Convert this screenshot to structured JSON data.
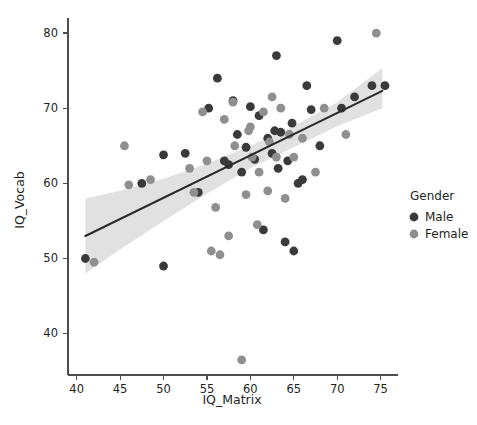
{
  "chart_data": {
    "type": "scatter",
    "title": "",
    "xlabel": "IQ_Matrix",
    "ylabel": "IQ_Vocab",
    "xlim": [
      39.0,
      77.0
    ],
    "ylim": [
      34.5,
      82.0
    ],
    "xticks": [
      40,
      45,
      50,
      55,
      60,
      65,
      70,
      75
    ],
    "yticks": [
      40,
      50,
      60,
      70,
      80
    ],
    "xtick_labels": [
      "40",
      "45",
      "50",
      "55",
      "60",
      "65",
      "70",
      "75"
    ],
    "ytick_labels": [
      "40",
      "50",
      "60",
      "70",
      "80"
    ],
    "grid": false,
    "legend_position": "right",
    "legend": {
      "title": "Gender",
      "entries": [
        {
          "label": "Male",
          "color": "#3a3a3a"
        },
        {
          "label": "Female",
          "color": "#8f8f8f"
        }
      ]
    },
    "series": [
      {
        "name": "Male",
        "color": "#3a3a3a",
        "marker": "circle",
        "points": [
          [
            41.0,
            50.0
          ],
          [
            47.5,
            60.0
          ],
          [
            50.0,
            49.0
          ],
          [
            50.0,
            63.8
          ],
          [
            54.0,
            58.8
          ],
          [
            55.2,
            70.0
          ],
          [
            56.2,
            74.0
          ],
          [
            57.0,
            63.0
          ],
          [
            57.5,
            62.5
          ],
          [
            58.5,
            66.5
          ],
          [
            59.0,
            61.5
          ],
          [
            59.5,
            64.8
          ],
          [
            60.0,
            70.2
          ],
          [
            60.5,
            63.2
          ],
          [
            61.0,
            69.0
          ],
          [
            61.5,
            53.8
          ],
          [
            62.0,
            66.0
          ],
          [
            62.5,
            64.0
          ],
          [
            62.8,
            67.0
          ],
          [
            63.0,
            77.0
          ],
          [
            63.2,
            62.0
          ],
          [
            63.5,
            66.8
          ],
          [
            64.0,
            52.2
          ],
          [
            64.3,
            63.0
          ],
          [
            64.8,
            68.0
          ],
          [
            65.0,
            51.0
          ],
          [
            65.5,
            60.0
          ],
          [
            66.0,
            60.5
          ],
          [
            66.5,
            73.0
          ],
          [
            67.0,
            69.8
          ],
          [
            68.0,
            65.0
          ],
          [
            70.0,
            79.0
          ],
          [
            70.5,
            70.0
          ],
          [
            72.0,
            71.5
          ],
          [
            74.0,
            73.0
          ],
          [
            75.5,
            73.0
          ],
          [
            58.0,
            71.0
          ],
          [
            52.5,
            64.0
          ]
        ]
      },
      {
        "name": "Female",
        "color": "#8f8f8f",
        "marker": "circle",
        "points": [
          [
            42.0,
            49.5
          ],
          [
            45.5,
            65.0
          ],
          [
            46.0,
            59.8
          ],
          [
            48.5,
            60.5
          ],
          [
            53.0,
            62.0
          ],
          [
            54.5,
            69.5
          ],
          [
            55.0,
            63.0
          ],
          [
            55.5,
            51.0
          ],
          [
            56.0,
            56.8
          ],
          [
            56.5,
            50.5
          ],
          [
            57.0,
            68.5
          ],
          [
            57.5,
            53.0
          ],
          [
            58.0,
            70.8
          ],
          [
            58.2,
            65.0
          ],
          [
            59.0,
            36.5
          ],
          [
            59.5,
            58.5
          ],
          [
            60.0,
            67.5
          ],
          [
            60.2,
            63.5
          ],
          [
            60.8,
            54.5
          ],
          [
            61.0,
            61.5
          ],
          [
            61.5,
            69.5
          ],
          [
            62.0,
            59.0
          ],
          [
            62.2,
            65.5
          ],
          [
            62.5,
            71.5
          ],
          [
            63.0,
            63.5
          ],
          [
            63.5,
            70.0
          ],
          [
            64.0,
            58.0
          ],
          [
            64.5,
            66.5
          ],
          [
            65.0,
            63.5
          ],
          [
            66.0,
            66.0
          ],
          [
            67.5,
            61.5
          ],
          [
            68.5,
            70.0
          ],
          [
            71.0,
            66.5
          ],
          [
            74.5,
            80.0
          ],
          [
            53.5,
            58.8
          ],
          [
            59.8,
            67.0
          ]
        ]
      }
    ],
    "fit_line": {
      "name": "linear-regression",
      "color": "#2b2b2b",
      "x_start": 41.0,
      "x_end": 75.2,
      "y_start": 53.0,
      "y_end": 72.3
    },
    "confidence_band": {
      "name": "confidence-interval",
      "color": "#c9c9c9",
      "upper": [
        [
          41.0,
          58.0
        ],
        [
          45.0,
          59.0
        ],
        [
          50.0,
          60.6
        ],
        [
          55.0,
          62.6
        ],
        [
          60.0,
          65.0
        ],
        [
          65.0,
          67.6
        ],
        [
          70.0,
          70.8
        ],
        [
          75.2,
          75.3
        ]
      ],
      "lower": [
        [
          41.0,
          48.0
        ],
        [
          45.0,
          51.2
        ],
        [
          50.0,
          55.0
        ],
        [
          55.0,
          58.6
        ],
        [
          60.0,
          62.0
        ],
        [
          65.0,
          64.8
        ],
        [
          70.0,
          67.6
        ],
        [
          75.2,
          70.0
        ]
      ]
    }
  }
}
